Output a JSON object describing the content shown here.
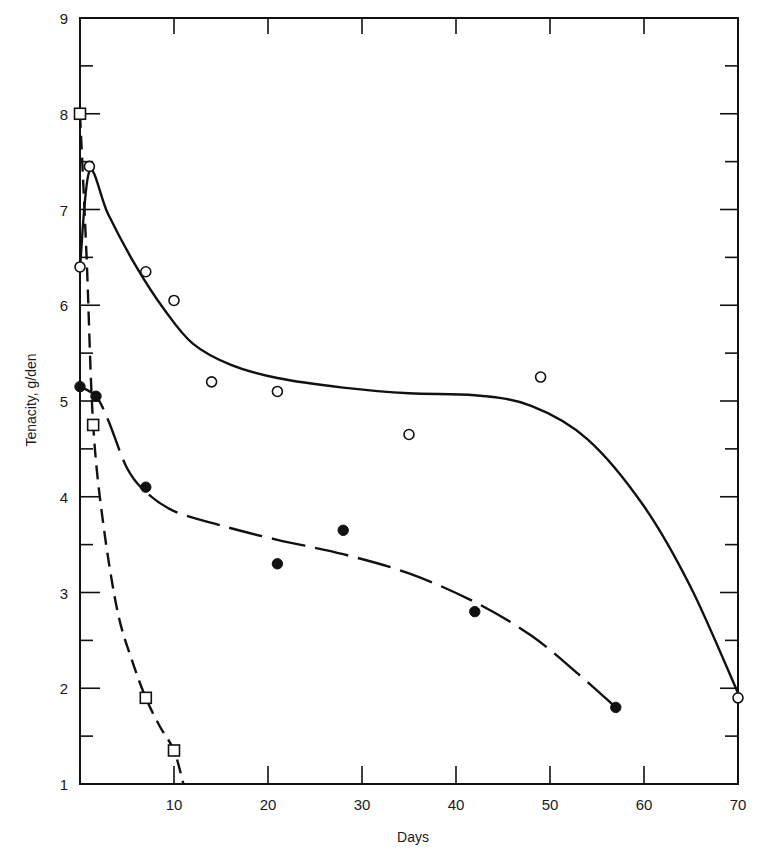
{
  "chart_data": {
    "type": "scatter",
    "title": "",
    "xlabel": "Days",
    "ylabel": "Tenacity, g/den",
    "xlim": [
      0,
      70
    ],
    "ylim": [
      1,
      9
    ],
    "x_ticks": [
      10,
      20,
      30,
      40,
      50,
      60,
      70
    ],
    "x_tick_labels": [
      "10",
      "20",
      "30",
      "40",
      "50",
      "60",
      "70"
    ],
    "y_ticks": [
      1,
      2,
      3,
      4,
      5,
      6,
      7,
      8,
      9
    ],
    "y_tick_labels": [
      "1",
      "2",
      "3",
      "4",
      "5",
      "6",
      "7",
      "8",
      "9"
    ],
    "y_minor_ticks": [
      1.5,
      2.5,
      3.5,
      4.5,
      5.5,
      6.5,
      7.5,
      8.5
    ],
    "grid": false,
    "legend": null,
    "series": [
      {
        "name": "open-circles",
        "marker": "open-circle",
        "line_style": "solid",
        "points": [
          {
            "x": 0,
            "y": 6.4
          },
          {
            "x": 1,
            "y": 7.45
          },
          {
            "x": 7,
            "y": 6.35
          },
          {
            "x": 10,
            "y": 6.05
          },
          {
            "x": 14,
            "y": 5.2
          },
          {
            "x": 21,
            "y": 5.1
          },
          {
            "x": 35,
            "y": 4.65
          },
          {
            "x": 49,
            "y": 5.25
          },
          {
            "x": 70,
            "y": 1.9
          }
        ],
        "fit_curve": [
          [
            0,
            6.4
          ],
          [
            1,
            7.4
          ],
          [
            3,
            6.95
          ],
          [
            6,
            6.4
          ],
          [
            9,
            5.95
          ],
          [
            12,
            5.6
          ],
          [
            16,
            5.38
          ],
          [
            21,
            5.24
          ],
          [
            28,
            5.14
          ],
          [
            35,
            5.08
          ],
          [
            42,
            5.06
          ],
          [
            48,
            4.95
          ],
          [
            54,
            4.6
          ],
          [
            60,
            3.9
          ],
          [
            65,
            3.05
          ],
          [
            70,
            1.95
          ]
        ]
      },
      {
        "name": "filled-circles",
        "marker": "filled-circle",
        "line_style": "long-dash",
        "points": [
          {
            "x": 0,
            "y": 5.15
          },
          {
            "x": 1.7,
            "y": 5.05
          },
          {
            "x": 7,
            "y": 4.1
          },
          {
            "x": 21,
            "y": 3.3
          },
          {
            "x": 28,
            "y": 3.65
          },
          {
            "x": 42,
            "y": 2.8
          },
          {
            "x": 57,
            "y": 1.8
          }
        ],
        "fit_curve": [
          [
            0,
            5.15
          ],
          [
            1.7,
            5.05
          ],
          [
            3,
            4.8
          ],
          [
            5,
            4.3
          ],
          [
            7,
            4.05
          ],
          [
            10,
            3.85
          ],
          [
            15,
            3.7
          ],
          [
            21,
            3.55
          ],
          [
            28,
            3.4
          ],
          [
            35,
            3.2
          ],
          [
            42,
            2.9
          ],
          [
            48,
            2.55
          ],
          [
            53,
            2.15
          ],
          [
            57,
            1.8
          ]
        ]
      },
      {
        "name": "open-squares",
        "marker": "open-square",
        "line_style": "short-dash",
        "points": [
          {
            "x": 0,
            "y": 8.0
          },
          {
            "x": 1.4,
            "y": 4.75
          },
          {
            "x": 7,
            "y": 1.9
          },
          {
            "x": 10,
            "y": 1.35
          }
        ],
        "fit_curve": [
          [
            0,
            8.0
          ],
          [
            0.7,
            6.5
          ],
          [
            1.4,
            4.75
          ],
          [
            2.5,
            3.7
          ],
          [
            4,
            2.8
          ],
          [
            5.5,
            2.3
          ],
          [
            7,
            1.9
          ],
          [
            8.5,
            1.6
          ],
          [
            10,
            1.35
          ],
          [
            11,
            1.0
          ]
        ]
      }
    ]
  }
}
